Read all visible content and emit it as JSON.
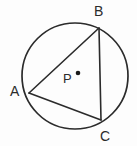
{
  "figure": {
    "background_color": "#fdfdfd",
    "stroke_color": "#2b2b2b",
    "label_color": "#2b2b2b",
    "canvas": {
      "width": 137,
      "height": 146
    }
  },
  "circle": {
    "name": "circle-P",
    "center": {
      "x": 75,
      "y": 76
    },
    "radius": 53,
    "stroke_width": 1.6,
    "fill": "none"
  },
  "center_point": {
    "label": "P",
    "dot": {
      "x": 78,
      "y": 73
    },
    "dot_radius": 2.2
  },
  "vertices": [
    {
      "label": "A",
      "x": 29,
      "y": 93,
      "label_x": 10,
      "label_y": 84
    },
    {
      "label": "B",
      "x": 99,
      "y": 28,
      "label_x": 94,
      "label_y": 4
    },
    {
      "label": "C",
      "x": 101,
      "y": 120,
      "label_x": 100,
      "label_y": 129
    }
  ],
  "chords": [
    {
      "name": "chord-AB",
      "from": "A",
      "to": "B"
    },
    {
      "name": "chord-BC",
      "from": "B",
      "to": "C"
    },
    {
      "name": "chord-AC",
      "from": "A",
      "to": "C"
    }
  ],
  "labels": {
    "A": "A",
    "B": "B",
    "C": "C",
    "P": "P"
  }
}
